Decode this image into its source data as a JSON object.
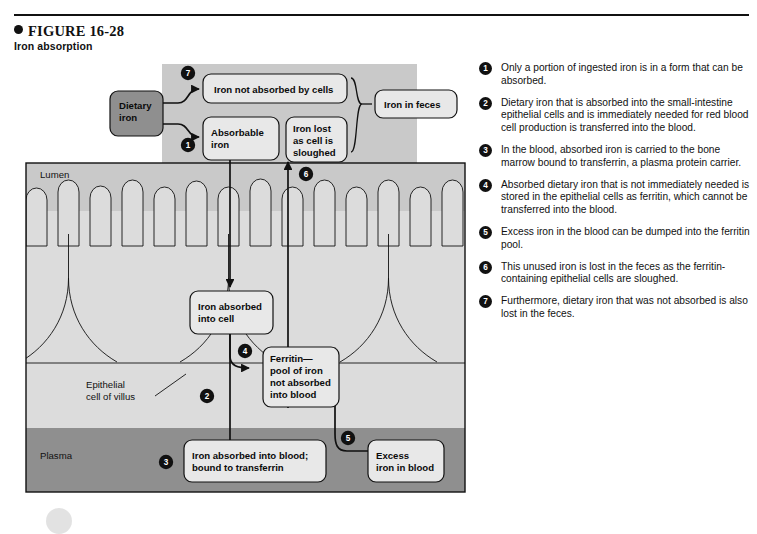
{
  "figure": {
    "number_label": "FIGURE 16-28",
    "title": "Iron absorption",
    "bullet_icon": "filled-circle-icon"
  },
  "colors": {
    "lumen_fill": "#c9c9c9",
    "epithelium_fill": "#dcdcdc",
    "plasma_fill": "#8f8f8f",
    "box_fill": "#e8e8e8",
    "dietary_box_fill": "#8f8f8f",
    "stroke": "#111111",
    "badge_fill": "#111111",
    "badge_text": "#ffffff",
    "page_background": "#ffffff"
  },
  "diagram": {
    "region_labels": {
      "lumen": "Lumen",
      "plasma": "Plasma",
      "epithelial_cell": "Epithelial\ncell of villus",
      "epithelial_cell_line1": "Epithelial",
      "epithelial_cell_line2": "cell of villus"
    },
    "boxes": {
      "dietary_iron": {
        "line1": "Dietary",
        "line2": "iron"
      },
      "iron_not_absorbed": {
        "line1": "Iron not absorbed by cells"
      },
      "absorbable_iron": {
        "line1": "Absorbable",
        "line2": "iron"
      },
      "iron_lost_sloughed": {
        "line1": "Iron lost",
        "line2": "as cell is",
        "line3": "sloughed"
      },
      "iron_in_feces": {
        "line1": "Iron in feces"
      },
      "iron_absorbed_into_cell": {
        "line1": "Iron absorbed",
        "line2": "into cell"
      },
      "ferritin_pool": {
        "line1": "Ferritin—",
        "line2": "pool of iron",
        "line3": "not absorbed",
        "line4": "into blood"
      },
      "iron_absorbed_into_blood": {
        "line1": "Iron absorbed into blood;",
        "line2": "bound to transferrin"
      },
      "excess_iron_in_blood": {
        "line1": "Excess",
        "line2": "iron in blood"
      }
    },
    "step_badges": [
      "1",
      "2",
      "3",
      "4",
      "5",
      "6",
      "7"
    ]
  },
  "legend": {
    "items": [
      {
        "number": "1",
        "text": "Only a portion of ingested iron is in a form that can be absorbed."
      },
      {
        "number": "2",
        "text": "Dietary iron that is absorbed into the small-intestine epithelial cells and is immediately needed for red blood cell production is transferred into the blood."
      },
      {
        "number": "3",
        "text": "In the blood, absorbed iron is carried to the bone marrow bound to transferrin, a plasma protein carrier."
      },
      {
        "number": "4",
        "text": "Absorbed dietary iron that is not immediately needed is stored in the epithelial cells as ferritin, which cannot be transferred into the blood."
      },
      {
        "number": "5",
        "text": "Excess iron in the blood can be dumped into the ferritin pool."
      },
      {
        "number": "6",
        "text": "This unused iron is lost in the feces as the ferritin-containing epithelial cells are sloughed."
      },
      {
        "number": "7",
        "text": "Furthermore, dietary iron that was not absorbed is also lost in the feces."
      }
    ]
  }
}
